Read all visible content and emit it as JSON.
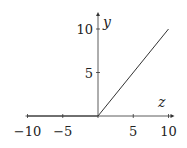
{
  "chart_data": {
    "type": "line",
    "title": "",
    "xlabel": "z",
    "ylabel": "y",
    "xlim": [
      -10,
      10
    ],
    "ylim": [
      0,
      10
    ],
    "x_ticks": [
      -10,
      -5,
      5,
      10
    ],
    "x_tick_labels": [
      "−10",
      "−5",
      "5",
      "10"
    ],
    "y_ticks": [
      5,
      10
    ],
    "y_tick_labels": [
      "5",
      "10"
    ],
    "grid": false,
    "series": [
      {
        "name": "ReLU",
        "x": [
          -10,
          0,
          10
        ],
        "y": [
          0,
          0,
          10
        ]
      }
    ]
  }
}
